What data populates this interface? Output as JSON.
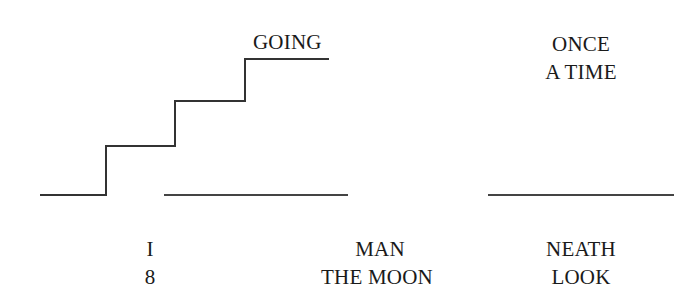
{
  "puzzles": [
    {
      "id": "stairs",
      "words": [
        "GOING"
      ],
      "drawing": "staircase-ascending"
    },
    {
      "id": "blank-middle",
      "drawing": "horizontal-line"
    },
    {
      "id": "top-right",
      "words": [
        "ONCE",
        "A TIME"
      ],
      "drawing": "horizontal-line-below"
    },
    {
      "id": "bottom-left",
      "words": [
        "I",
        "8"
      ]
    },
    {
      "id": "bottom-middle",
      "words": [
        "MAN",
        "THE MOON"
      ]
    },
    {
      "id": "bottom-right",
      "words": [
        "NEATH",
        "LOOK"
      ]
    }
  ],
  "style": {
    "line_color": "#333333",
    "text_color": "#1a1a1a",
    "background": "#ffffff"
  }
}
